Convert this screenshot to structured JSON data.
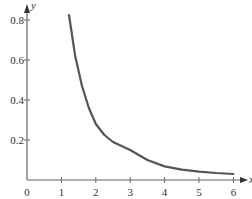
{
  "chart_data": {
    "type": "line",
    "title": "",
    "xlabel": "x",
    "ylabel": "y",
    "xlim": [
      0,
      6
    ],
    "ylim": [
      0,
      0.85
    ],
    "grid": false,
    "legend": null,
    "x_ticks": [
      "0",
      "1",
      "2",
      "3",
      "4",
      "5",
      "6"
    ],
    "y_ticks": [
      "0.2",
      "0.4",
      "0.6",
      "0.8"
    ],
    "series": [
      {
        "name": "curve",
        "color": "#555555",
        "x": [
          1.22,
          1.4,
          1.6,
          1.8,
          2.0,
          2.25,
          2.5,
          2.75,
          3.0,
          3.5,
          4.0,
          4.5,
          5.0,
          5.5,
          6.0
        ],
        "y": [
          0.825,
          0.62,
          0.47,
          0.36,
          0.28,
          0.225,
          0.19,
          0.17,
          0.15,
          0.1,
          0.068,
          0.052,
          0.042,
          0.035,
          0.03
        ]
      }
    ]
  }
}
